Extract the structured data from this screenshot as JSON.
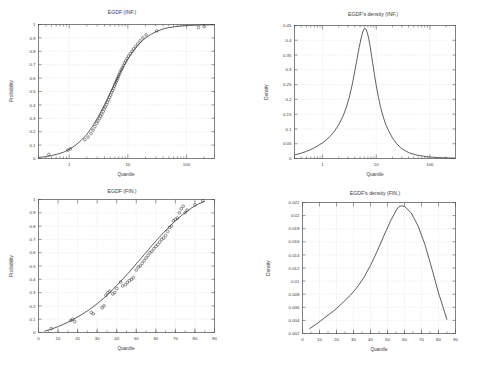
{
  "figure": {
    "background": "#ffffff",
    "curve_color": "#2a2a2a",
    "grid_color": "#c8c8d2",
    "axis_color": "#4a4a4a"
  },
  "panels": {
    "top_left": {
      "title": "EGDF (INF.)",
      "xlabel": "Quantile",
      "ylabel": "Probability"
    },
    "top_right": {
      "title": "EGDF's density (INF.)",
      "xlabel": "Quantile",
      "ylabel": "Density"
    },
    "bottom_left": {
      "title": "EGDF (FIN.)",
      "xlabel": "Quantile",
      "ylabel": "Probability"
    },
    "bottom_right": {
      "title": "EGDF's density (FIN.)",
      "xlabel": "Quantile",
      "ylabel": "Density"
    }
  },
  "chart_data": [
    {
      "id": "egdf-inf",
      "type": "line",
      "title": "EGDF (INF.)",
      "xlabel": "Quantile",
      "ylabel": "Probability",
      "xscale": "log",
      "yscale": "linear",
      "xlim": [
        0.3,
        300
      ],
      "ylim": [
        0,
        1
      ],
      "grid": true,
      "legend": "none",
      "xticks": [
        1,
        10,
        100
      ],
      "xticklabels": [
        "1",
        "10",
        "100"
      ],
      "yticks": [
        0,
        0.1,
        0.2,
        0.3,
        0.4,
        0.5,
        0.6,
        0.7,
        0.8,
        0.9,
        1
      ],
      "yticklabels": [
        "0",
        "0.1",
        "0.2",
        "0.3",
        "0.4",
        "0.5",
        "0.6",
        "0.7",
        "0.8",
        "0.9",
        "1"
      ],
      "series": [
        {
          "name": "fitted EGDF",
          "style": "line",
          "x": [
            0.3,
            0.4,
            0.5,
            0.65,
            0.8,
            1.0,
            1.25,
            1.6,
            2.0,
            2.5,
            3.0,
            3.5,
            4.0,
            4.5,
            5.0,
            5.5,
            6.0,
            6.5,
            7.0,
            7.5,
            8.0,
            9.0,
            10.0,
            11.0,
            12.0,
            14.0,
            16.0,
            18.0,
            20.0,
            25.0,
            30.0,
            40.0,
            50.0,
            70.0,
            100.0,
            150.0,
            200.0,
            300.0
          ],
          "y": [
            0.008,
            0.014,
            0.022,
            0.034,
            0.047,
            0.068,
            0.095,
            0.135,
            0.18,
            0.24,
            0.298,
            0.352,
            0.402,
            0.448,
            0.49,
            0.527,
            0.561,
            0.592,
            0.62,
            0.645,
            0.668,
            0.708,
            0.742,
            0.77,
            0.794,
            0.832,
            0.86,
            0.882,
            0.899,
            0.928,
            0.946,
            0.967,
            0.977,
            0.986,
            0.992,
            0.995,
            0.997,
            0.998
          ]
        },
        {
          "name": "empirical points",
          "style": "circles",
          "x": [
            0.45,
            0.95,
            1.05,
            1.85,
            2.1,
            2.35,
            2.55,
            2.75,
            2.95,
            3.1,
            3.3,
            3.45,
            3.6,
            3.8,
            3.95,
            4.1,
            4.3,
            4.5,
            4.7,
            4.9,
            5.1,
            5.3,
            5.5,
            5.7,
            5.9,
            6.1,
            6.3,
            6.5,
            6.7,
            6.9,
            7.1,
            7.4,
            7.7,
            8.0,
            8.4,
            8.8,
            9.2,
            9.7,
            10.3,
            11.0,
            11.8,
            12.6,
            13.6,
            14.8,
            16.2,
            18.0,
            20.5,
            31.0,
            160.0,
            200.0
          ],
          "y": [
            0.03,
            0.062,
            0.072,
            0.14,
            0.16,
            0.186,
            0.212,
            0.238,
            0.262,
            0.28,
            0.3,
            0.316,
            0.33,
            0.35,
            0.368,
            0.384,
            0.402,
            0.42,
            0.438,
            0.456,
            0.474,
            0.492,
            0.508,
            0.524,
            0.54,
            0.556,
            0.57,
            0.584,
            0.598,
            0.612,
            0.626,
            0.644,
            0.66,
            0.676,
            0.694,
            0.712,
            0.728,
            0.746,
            0.764,
            0.782,
            0.8,
            0.818,
            0.836,
            0.856,
            0.878,
            0.9,
            0.922,
            0.952,
            0.978,
            0.984
          ]
        }
      ]
    },
    {
      "id": "egdf-density-inf",
      "type": "line",
      "title": "EGDF's density (INF.)",
      "xlabel": "Quantile",
      "ylabel": "Density",
      "xscale": "log",
      "yscale": "linear",
      "xlim": [
        0.3,
        300
      ],
      "ylim": [
        0,
        0.45
      ],
      "grid": true,
      "legend": "none",
      "xticks": [
        1,
        10,
        100
      ],
      "xticklabels": [
        "1",
        "10",
        "100"
      ],
      "yticks": [
        0,
        0.05,
        0.1,
        0.15,
        0.2,
        0.25,
        0.3,
        0.35,
        0.4,
        0.45
      ],
      "yticklabels": [
        "0",
        "0.05",
        "0.1",
        "0.15",
        "0.2",
        "0.25",
        "0.3",
        "0.35",
        "0.4",
        "0.45"
      ],
      "peak": {
        "x": 6.0,
        "y": 0.44
      },
      "series": [
        {
          "name": "density",
          "style": "line",
          "x": [
            0.3,
            0.4,
            0.5,
            0.65,
            0.8,
            1.0,
            1.3,
            1.6,
            2.0,
            2.4,
            2.8,
            3.2,
            3.6,
            4.0,
            4.4,
            4.8,
            5.2,
            5.6,
            6.0,
            6.4,
            6.8,
            7.2,
            7.6,
            8.0,
            8.6,
            9.2,
            10.0,
            11.0,
            12.0,
            13.5,
            15.0,
            17.0,
            20.0,
            24.0,
            30.0,
            40.0,
            55.0,
            75.0,
            100.0,
            150.0,
            220.0,
            300.0
          ],
          "y": [
            0.012,
            0.018,
            0.024,
            0.033,
            0.042,
            0.053,
            0.07,
            0.088,
            0.114,
            0.143,
            0.175,
            0.212,
            0.253,
            0.297,
            0.338,
            0.375,
            0.405,
            0.428,
            0.44,
            0.438,
            0.427,
            0.408,
            0.385,
            0.36,
            0.322,
            0.287,
            0.247,
            0.207,
            0.175,
            0.141,
            0.116,
            0.094,
            0.07,
            0.05,
            0.033,
            0.02,
            0.012,
            0.008,
            0.005,
            0.003,
            0.002,
            0.001
          ]
        }
      ]
    },
    {
      "id": "egdf-fin",
      "type": "line",
      "title": "EGDF (FIN.)",
      "xlabel": "Quantile",
      "ylabel": "Probability",
      "xscale": "linear",
      "yscale": "linear",
      "xlim": [
        0,
        90
      ],
      "ylim": [
        0,
        1
      ],
      "grid": true,
      "legend": "none",
      "xticks": [
        0,
        10,
        20,
        30,
        40,
        50,
        60,
        70,
        80,
        90
      ],
      "xticklabels": [
        "0",
        "10",
        "20",
        "30",
        "40",
        "50",
        "60",
        "70",
        "80",
        "90"
      ],
      "yticks": [
        0,
        0.1,
        0.2,
        0.3,
        0.4,
        0.5,
        0.6,
        0.7,
        0.8,
        0.9,
        1
      ],
      "yticklabels": [
        "0",
        "0.1",
        "0.2",
        "0.3",
        "0.4",
        "0.5",
        "0.6",
        "0.7",
        "0.8",
        "0.9",
        "1"
      ],
      "series": [
        {
          "name": "fitted EGDF",
          "style": "line",
          "x": [
            3,
            6,
            10,
            14,
            18,
            22,
            26,
            30,
            34,
            38,
            42,
            46,
            50,
            54,
            58,
            62,
            66,
            70,
            74,
            78,
            82,
            85
          ],
          "y": [
            0.01,
            0.022,
            0.044,
            0.07,
            0.1,
            0.134,
            0.172,
            0.216,
            0.266,
            0.322,
            0.384,
            0.448,
            0.516,
            0.584,
            0.654,
            0.72,
            0.782,
            0.84,
            0.89,
            0.934,
            0.968,
            0.986
          ]
        },
        {
          "name": "empirical points",
          "style": "circles",
          "x": [
            6.5,
            16.5,
            17.5,
            18.5,
            27.0,
            28.0,
            32.5,
            33.5,
            34.5,
            35.5,
            36.5,
            38.0,
            39.0,
            40.0,
            42.0,
            43.0,
            44.5,
            45.5,
            46.5,
            47.5,
            48.5,
            50.0,
            51.0,
            52.0,
            53.0,
            54.0,
            55.0,
            56.0,
            57.0,
            58.0,
            59.0,
            60.0,
            61.0,
            62.0,
            63.0,
            64.0,
            65.0,
            66.0,
            67.0,
            68.0,
            69.0,
            70.0,
            71.0,
            72.0,
            73.0,
            74.0,
            75.0,
            76.0,
            80.0,
            84.0
          ],
          "y": [
            0.03,
            0.09,
            0.1,
            0.082,
            0.15,
            0.14,
            0.186,
            0.2,
            0.28,
            0.3,
            0.31,
            0.29,
            0.3,
            0.33,
            0.38,
            0.35,
            0.36,
            0.376,
            0.39,
            0.4,
            0.412,
            0.47,
            0.492,
            0.5,
            0.52,
            0.54,
            0.56,
            0.58,
            0.6,
            0.61,
            0.63,
            0.648,
            0.66,
            0.68,
            0.7,
            0.71,
            0.73,
            0.76,
            0.79,
            0.8,
            0.84,
            0.85,
            0.86,
            0.9,
            0.93,
            0.95,
            0.9,
            0.92,
            0.96,
            0.99
          ]
        }
      ]
    },
    {
      "id": "egdf-density-fin",
      "type": "line",
      "title": "EGDF's density (FIN.)",
      "xlabel": "Quantile",
      "ylabel": "Density",
      "xscale": "linear",
      "yscale": "linear",
      "xlim": [
        0,
        90
      ],
      "ylim": [
        0.002,
        0.022
      ],
      "grid": true,
      "legend": "none",
      "xticks": [
        0,
        10,
        20,
        30,
        40,
        50,
        60,
        70,
        80,
        90
      ],
      "xticklabels": [
        "0",
        "10",
        "20",
        "30",
        "40",
        "50",
        "60",
        "70",
        "80",
        "90"
      ],
      "yticks": [
        0.002,
        0.004,
        0.006,
        0.008,
        0.01,
        0.012,
        0.014,
        0.016,
        0.018,
        0.02,
        0.022
      ],
      "yticklabels": [
        "0.002",
        "0.004",
        "0.006",
        "0.008",
        "0.01",
        "0.012",
        "0.014",
        "0.016",
        "0.018",
        "0.02",
        "0.022"
      ],
      "peak": {
        "x": 57,
        "y": 0.0215
      },
      "series": [
        {
          "name": "density",
          "style": "line",
          "x": [
            4,
            8,
            12,
            16,
            20,
            24,
            28,
            32,
            36,
            40,
            44,
            48,
            52,
            56,
            58,
            60,
            64,
            68,
            72,
            76,
            80,
            85
          ],
          "y": [
            0.0027,
            0.0034,
            0.0042,
            0.005,
            0.0058,
            0.0068,
            0.0078,
            0.009,
            0.0105,
            0.0124,
            0.0146,
            0.017,
            0.0193,
            0.0212,
            0.0215,
            0.0214,
            0.0204,
            0.0184,
            0.0156,
            0.012,
            0.0082,
            0.0041
          ]
        }
      ]
    }
  ]
}
